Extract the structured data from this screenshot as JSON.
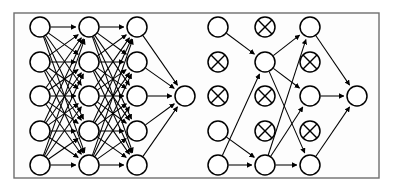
{
  "figure": {
    "background_color": "#ffffff",
    "frame_color": "#6e6e6e",
    "node_fill": "#ffffff",
    "node_stroke": "#000000",
    "edge_color": "#000000",
    "node_radius": 10,
    "dropped_marker": "crossed-circle",
    "frame": {
      "x": 14,
      "y": 13,
      "width": 365,
      "height": 165
    }
  },
  "panels": [
    {
      "id": "standard-network",
      "name": "Standard Neural Net",
      "layers": [
        {
          "id": "left-input",
          "name": "input-layer",
          "x": 40,
          "nodes": [
            {
              "id": "L1-1",
              "y": 27,
              "state": "active"
            },
            {
              "id": "L1-2",
              "y": 62,
              "state": "active"
            },
            {
              "id": "L1-3",
              "y": 96,
              "state": "active"
            },
            {
              "id": "L1-4",
              "y": 131,
              "state": "active"
            },
            {
              "id": "L1-5",
              "y": 165,
              "state": "active"
            }
          ]
        },
        {
          "id": "left-hidden-1",
          "name": "hidden-layer-1",
          "x": 89,
          "nodes": [
            {
              "id": "L2-1",
              "y": 27,
              "state": "active"
            },
            {
              "id": "L2-2",
              "y": 62,
              "state": "active"
            },
            {
              "id": "L2-3",
              "y": 96,
              "state": "active"
            },
            {
              "id": "L2-4",
              "y": 131,
              "state": "active"
            },
            {
              "id": "L2-5",
              "y": 165,
              "state": "active"
            }
          ]
        },
        {
          "id": "left-hidden-2",
          "name": "hidden-layer-2",
          "x": 137,
          "nodes": [
            {
              "id": "L3-1",
              "y": 27,
              "state": "active"
            },
            {
              "id": "L3-2",
              "y": 62,
              "state": "active"
            },
            {
              "id": "L3-3",
              "y": 96,
              "state": "active"
            },
            {
              "id": "L3-4",
              "y": 131,
              "state": "active"
            },
            {
              "id": "L3-5",
              "y": 165,
              "state": "active"
            }
          ]
        },
        {
          "id": "left-output",
          "name": "output-layer",
          "x": 185,
          "nodes": [
            {
              "id": "L4-1",
              "y": 96,
              "state": "active"
            }
          ]
        }
      ],
      "connectivity": "fully-connected"
    },
    {
      "id": "dropout-network",
      "name": "After applying dropout",
      "layers": [
        {
          "id": "right-input",
          "name": "input-layer",
          "x": 218,
          "nodes": [
            {
              "id": "R1-1",
              "y": 27,
              "state": "active"
            },
            {
              "id": "R1-2",
              "y": 62,
              "state": "dropped"
            },
            {
              "id": "R1-3",
              "y": 96,
              "state": "dropped"
            },
            {
              "id": "R1-4",
              "y": 131,
              "state": "active"
            },
            {
              "id": "R1-5",
              "y": 165,
              "state": "active"
            }
          ]
        },
        {
          "id": "right-hidden-1",
          "name": "hidden-layer-1",
          "x": 265,
          "nodes": [
            {
              "id": "R2-1",
              "y": 27,
              "state": "dropped"
            },
            {
              "id": "R2-2",
              "y": 62,
              "state": "active"
            },
            {
              "id": "R2-3",
              "y": 96,
              "state": "dropped"
            },
            {
              "id": "R2-4",
              "y": 131,
              "state": "dropped"
            },
            {
              "id": "R2-5",
              "y": 165,
              "state": "active"
            }
          ]
        },
        {
          "id": "right-hidden-2",
          "name": "hidden-layer-2",
          "x": 310,
          "nodes": [
            {
              "id": "R3-1",
              "y": 27,
              "state": "active"
            },
            {
              "id": "R3-2",
              "y": 62,
              "state": "dropped"
            },
            {
              "id": "R3-3",
              "y": 96,
              "state": "active"
            },
            {
              "id": "R3-4",
              "y": 131,
              "state": "dropped"
            },
            {
              "id": "R3-5",
              "y": 165,
              "state": "active"
            }
          ]
        },
        {
          "id": "right-output",
          "name": "output-layer",
          "x": 357,
          "nodes": [
            {
              "id": "R4-1",
              "y": 96,
              "state": "active"
            }
          ]
        }
      ],
      "edges": [
        {
          "from": "R1-1",
          "to": "R2-2"
        },
        {
          "from": "R1-4",
          "to": "R2-5"
        },
        {
          "from": "R1-5",
          "to": "R2-2"
        },
        {
          "from": "R1-5",
          "to": "R2-5"
        },
        {
          "from": "R2-2",
          "to": "R3-1"
        },
        {
          "from": "R2-2",
          "to": "R3-3"
        },
        {
          "from": "R2-2",
          "to": "R3-5"
        },
        {
          "from": "R2-5",
          "to": "R3-1"
        },
        {
          "from": "R2-5",
          "to": "R3-3"
        },
        {
          "from": "R2-5",
          "to": "R3-5"
        },
        {
          "from": "R3-1",
          "to": "R4-1"
        },
        {
          "from": "R3-3",
          "to": "R4-1"
        },
        {
          "from": "R3-5",
          "to": "R4-1"
        }
      ]
    }
  ]
}
